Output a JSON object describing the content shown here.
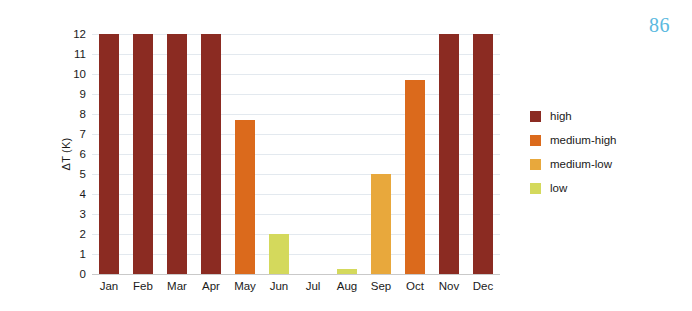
{
  "page": {
    "number": "86",
    "number_color": "#5bb9e0"
  },
  "chart_data": {
    "type": "bar",
    "title": "",
    "xlabel": "",
    "ylabel": "ΔT (K)",
    "ylim": [
      0,
      12
    ],
    "ytick_step": 1,
    "yticks": [
      "12",
      "11",
      "10",
      "9",
      "8",
      "7",
      "6",
      "5",
      "4",
      "3",
      "2",
      "1",
      "0"
    ],
    "grid": true,
    "grid_axis": "y",
    "legend_position": "right",
    "categories": [
      "Jan",
      "Feb",
      "Mar",
      "Apr",
      "May",
      "Jun",
      "Jul",
      "Aug",
      "Sep",
      "Oct",
      "Nov",
      "Dec"
    ],
    "values": [
      12,
      12,
      12,
      12,
      7.7,
      2.0,
      0,
      0.25,
      5.0,
      9.7,
      12,
      12
    ],
    "point_classes": [
      "high",
      "high",
      "high",
      "high",
      "medium-high",
      "low",
      "none",
      "low",
      "medium-low",
      "medium-high",
      "high",
      "high"
    ],
    "legend": [
      {
        "label": "high",
        "color": "#8b2b22"
      },
      {
        "label": "medium-high",
        "color": "#db6a1c"
      },
      {
        "label": "medium-low",
        "color": "#e8a83c"
      },
      {
        "label": "low",
        "color": "#d4d95c"
      }
    ],
    "bar_colors": [
      "#8b2b22",
      "#8b2b22",
      "#8b2b22",
      "#8b2b22",
      "#db6a1c",
      "#d4d95c",
      "transparent",
      "#d4d95c",
      "#e8a83c",
      "#db6a1c",
      "#8b2b22",
      "#8b2b22"
    ]
  }
}
